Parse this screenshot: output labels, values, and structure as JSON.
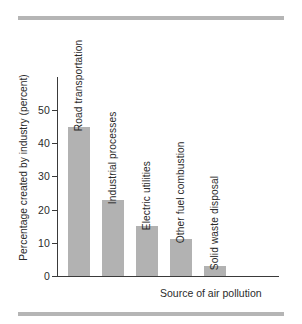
{
  "chart_data": {
    "type": "bar",
    "title": "",
    "xlabel": "Source of air pollution",
    "ylabel": "Percentage created by industry (percent)",
    "categories": [
      "Road transportation",
      "Industrial processes",
      "Electric utilities",
      "Other fuel combustion",
      "Solid waste disposal"
    ],
    "values": [
      45,
      23,
      15,
      11,
      3
    ],
    "ylim": [
      0,
      57
    ],
    "yticks": [
      0,
      10,
      20,
      30,
      40,
      50
    ],
    "ytick_labels": [
      "0",
      "10",
      "20",
      "30",
      "40",
      "50"
    ],
    "grid": false,
    "legend": false,
    "bar_color": "#b2b2b2",
    "axis_color": "#3a3a3a",
    "rule_color": "#b5b5b5"
  },
  "decoration": {
    "top_rule": "horizontal-rule",
    "bottom_rule": "horizontal-rule"
  }
}
